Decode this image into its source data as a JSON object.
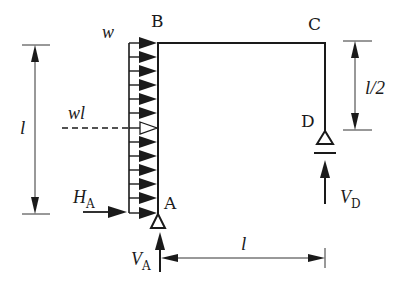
{
  "diagram": {
    "type": "structural-frame",
    "nodes": {
      "A": {
        "label": "A",
        "support": "pin"
      },
      "B": {
        "label": "B"
      },
      "C": {
        "label": "C"
      },
      "D": {
        "label": "D",
        "support": "roller"
      }
    },
    "members": [
      {
        "from": "A",
        "to": "B",
        "orientation": "vertical",
        "length": "l"
      },
      {
        "from": "B",
        "to": "C",
        "orientation": "horizontal",
        "length": "l"
      },
      {
        "from": "C",
        "to": "D",
        "orientation": "vertical",
        "length": "l/2"
      }
    ],
    "load": {
      "intensity_label": "w",
      "resultant_label": "wl",
      "arrow_count": 13,
      "resultant_arrow_index": 6
    },
    "reactions": {
      "HA": {
        "symbol": "H",
        "subscript": "A"
      },
      "VA": {
        "symbol": "V",
        "subscript": "A"
      },
      "VD": {
        "symbol": "V",
        "subscript": "D"
      }
    },
    "dimensions": {
      "left_height": "l",
      "right_height": "l/2",
      "bottom_span": "l"
    },
    "colors": {
      "line": "#1a1a1a",
      "dim_line": "#333333",
      "background": "#ffffff"
    }
  }
}
